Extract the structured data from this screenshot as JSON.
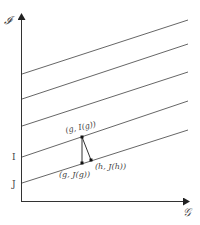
{
  "diagram": {
    "y_axis_label": "𝓘",
    "x_axis_label": "𝒢",
    "level_labels": {
      "I": "I",
      "J": "J"
    },
    "points": {
      "g_I": "(g, I(g))",
      "g_J": "(g, J(g))",
      "h_J": "(h, J(h))"
    },
    "colors": {
      "line": "#555555",
      "axis": "#333333",
      "point": "#111111",
      "text": "#444444"
    }
  }
}
